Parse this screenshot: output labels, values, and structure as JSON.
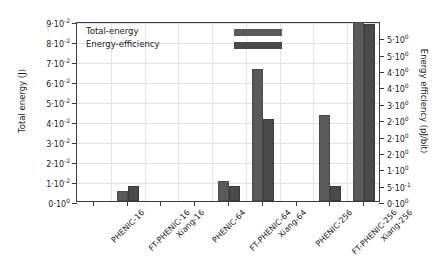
{
  "chart_data": {
    "type": "bar",
    "title": "",
    "xlabel": "",
    "ylabel": "Total energy (J)",
    "y2label": "Energy efficiency (pJ/bit)",
    "grid": true,
    "legend_position": "top-left-inside",
    "categories": [
      "PHENIC-16",
      "FT-PHENIC-16",
      "Xiang-16",
      "PHENIC-64",
      "FT-PHENIC-64",
      "Xiang-64",
      "PHENIC-256",
      "FT-PHENIC-256",
      "Xiang-256"
    ],
    "series": [
      {
        "name": "Total-energy",
        "axis": "left",
        "color": "#5a5a5a",
        "values": [
          0.0,
          0.005,
          0.0,
          0.0,
          0.01,
          0.066,
          0.0,
          0.043,
          0.0895
        ]
      },
      {
        "name": "Energy-efficiency",
        "axis": "right",
        "color": "#4a4a4a",
        "values": [
          0.0,
          0.45,
          0.0,
          0.0,
          0.45,
          2.5,
          0.0,
          0.45,
          5.4
        ]
      }
    ],
    "ylim": [
      0,
      0.09
    ],
    "y2lim": [
      0,
      5.5
    ],
    "yticks": [
      {
        "value": 0.0,
        "label": "0·10",
        "exp": "0"
      },
      {
        "value": 0.01,
        "label": "1·10",
        "exp": "-2"
      },
      {
        "value": 0.02,
        "label": "2·10",
        "exp": "-2"
      },
      {
        "value": 0.03,
        "label": "3·10",
        "exp": "-2"
      },
      {
        "value": 0.04,
        "label": "4·10",
        "exp": "-2"
      },
      {
        "value": 0.05,
        "label": "5·10",
        "exp": "-2"
      },
      {
        "value": 0.06,
        "label": "6·10",
        "exp": "-2"
      },
      {
        "value": 0.07,
        "label": "7·10",
        "exp": "-2"
      },
      {
        "value": 0.08,
        "label": "8·10",
        "exp": "-2"
      },
      {
        "value": 0.09,
        "label": "9·10",
        "exp": "-2"
      }
    ],
    "y2ticks": [
      {
        "value": 0.0,
        "label": "0·10",
        "exp": "0"
      },
      {
        "value": 0.5,
        "label": "5·10",
        "exp": "-1"
      },
      {
        "value": 1.0,
        "label": "1·10",
        "exp": "0"
      },
      {
        "value": 1.5,
        "label": "2·10",
        "exp": "0"
      },
      {
        "value": 2.0,
        "label": "2·10",
        "exp": "0"
      },
      {
        "value": 2.5,
        "label": "2·10",
        "exp": "0"
      },
      {
        "value": 3.0,
        "label": "3·10",
        "exp": "0"
      },
      {
        "value": 3.5,
        "label": "4·10",
        "exp": "0"
      },
      {
        "value": 4.0,
        "label": "4·10",
        "exp": "0"
      },
      {
        "value": 4.5,
        "label": "5·10",
        "exp": "0"
      },
      {
        "value": 5.0,
        "label": "5·10",
        "exp": "0"
      }
    ]
  },
  "legend": {
    "items": [
      {
        "label": "Total-energy"
      },
      {
        "label": "Energy-efficiency"
      }
    ]
  },
  "axes": {
    "left_title": "Total energy (J)",
    "right_title": "Energy efficiency (pJ/bit)"
  }
}
